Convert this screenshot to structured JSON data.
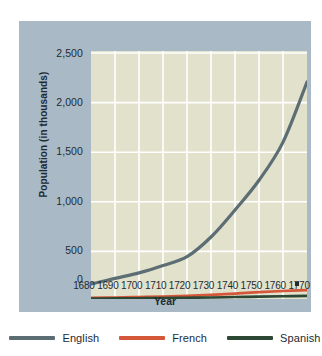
{
  "chart_data": {
    "type": "line",
    "title": "",
    "xlabel": "Year",
    "ylabel": "Population (in thousands)",
    "xlim": [
      1680,
      1770
    ],
    "ylim": [
      0,
      2500
    ],
    "x": [
      1680,
      1690,
      1700,
      1710,
      1720,
      1730,
      1740,
      1750,
      1760,
      1770
    ],
    "xtick_labels": [
      "1680",
      "1690",
      "1700",
      "1710",
      "1720",
      "1730",
      "1740",
      "1750",
      "1760",
      "1770"
    ],
    "ytick_labels": [
      "2,500",
      "2,000",
      "1,500",
      "1,000",
      "500",
      "0"
    ],
    "ytick_values": [
      2500,
      2000,
      1500,
      1000,
      500,
      0
    ],
    "grid": true,
    "legend_position": "bottom",
    "series": [
      {
        "name": "English",
        "color": "#5c6e74",
        "values": [
          152,
          210,
          265,
          340,
          430,
          630,
          905,
          1207,
          1594,
          2205
        ]
      },
      {
        "name": "French",
        "color": "#d4573a",
        "values": [
          12,
          15,
          20,
          25,
          32,
          42,
          55,
          70,
          82,
          90
        ]
      },
      {
        "name": "Spanish",
        "color": "#2c4733",
        "values": [
          5,
          6,
          8,
          10,
          13,
          16,
          20,
          24,
          28,
          32
        ]
      }
    ],
    "annotations": [
      {
        "name": "asterisk-marker",
        "x": 1766,
        "y": 150,
        "symbol": "*"
      }
    ]
  },
  "legend": {
    "items": [
      {
        "label": "English",
        "color": "#5c6e74"
      },
      {
        "label": "French",
        "color": "#d4573a"
      },
      {
        "label": "Spanish",
        "color": "#2c4733"
      }
    ]
  },
  "axes": {
    "x_title": "Year",
    "y_title": "Population (in thousands)"
  },
  "colors": {
    "frame": "#a9bac6",
    "plot_background": "#e2e1cc",
    "gridline": "#ffffff",
    "text": "#1d2b33"
  }
}
